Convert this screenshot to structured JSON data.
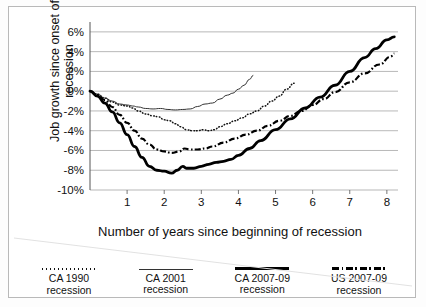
{
  "chart_data": {
    "type": "line",
    "title": "",
    "xlabel": "Number of years since beginning of recession",
    "ylabel": "Job growth since onset of recession",
    "xlim": [
      0,
      8.3
    ],
    "ylim": [
      -10,
      7
    ],
    "grid": true,
    "gridlines": "horizontal",
    "legend_position": "bottom",
    "ytick_labels": [
      "6%",
      "4%",
      "2%",
      "0%",
      "-2%",
      "-4%",
      "-6%",
      "-8%",
      "-10%"
    ],
    "ytick_values": [
      6,
      4,
      2,
      0,
      -2,
      -4,
      -6,
      -8,
      -10
    ],
    "xtick_labels": [
      "1",
      "2",
      "3",
      "4",
      "5",
      "6",
      "7",
      "8"
    ],
    "xtick_values": [
      1,
      2,
      3,
      4,
      5,
      6,
      7,
      8
    ],
    "series": [
      {
        "name": "CA 1990 recession",
        "style": "dotted",
        "color": "#111111",
        "x": [
          0,
          0.2,
          0.4,
          0.6,
          0.8,
          1.0,
          1.15,
          1.3,
          1.5,
          1.7,
          1.85,
          2.0,
          2.15,
          2.3,
          2.45,
          2.6,
          2.75,
          2.9,
          3.05,
          3.2,
          3.35,
          3.5,
          3.7,
          3.9,
          4.1,
          4.3,
          4.5,
          4.7,
          4.9,
          5.1,
          5.3,
          5.5
        ],
        "y": [
          0,
          -0.3,
          -0.7,
          -1.1,
          -1.4,
          -1.5,
          -1.7,
          -2.0,
          -2.3,
          -2.5,
          -2.6,
          -2.9,
          -3.0,
          -3.3,
          -3.6,
          -3.9,
          -4.0,
          -4.0,
          -3.9,
          -4.0,
          -3.9,
          -3.6,
          -3.3,
          -3.0,
          -2.7,
          -2.3,
          -2.0,
          -1.5,
          -1.0,
          -0.5,
          0.2,
          0.8
        ]
      },
      {
        "name": "CA 2001 recession",
        "style": "solid-thin",
        "color": "#333333",
        "x": [
          0,
          0.2,
          0.4,
          0.6,
          0.8,
          1.0,
          1.15,
          1.3,
          1.5,
          1.7,
          1.9,
          2.1,
          2.3,
          2.5,
          2.7,
          2.9,
          3.1,
          3.3,
          3.5,
          3.7,
          3.85,
          4.0,
          4.15,
          4.3,
          4.4
        ],
        "y": [
          0,
          -0.3,
          -0.7,
          -1.0,
          -1.3,
          -1.4,
          -1.5,
          -1.6,
          -1.75,
          -1.8,
          -1.75,
          -1.85,
          -1.9,
          -1.85,
          -1.8,
          -1.55,
          -1.3,
          -1.2,
          -0.8,
          -0.4,
          -0.2,
          0.2,
          0.6,
          1.2,
          1.6
        ]
      },
      {
        "name": "CA 2007-09 recession",
        "style": "solid-thick",
        "color": "#000000",
        "x": [
          0,
          0.2,
          0.4,
          0.6,
          0.8,
          1.0,
          1.2,
          1.4,
          1.6,
          1.8,
          2.0,
          2.2,
          2.35,
          2.5,
          2.6,
          2.8,
          3.0,
          3.2,
          3.4,
          3.6,
          3.8,
          4.0,
          4.3,
          4.6,
          5.0,
          5.4,
          5.8,
          6.2,
          6.6,
          7.0,
          7.4,
          7.7,
          8.0,
          8.2
        ],
        "y": [
          0,
          -0.5,
          -1.2,
          -2.1,
          -3.2,
          -4.4,
          -5.6,
          -6.7,
          -7.6,
          -8.0,
          -8.1,
          -8.3,
          -8.0,
          -7.6,
          -7.8,
          -7.8,
          -7.6,
          -7.4,
          -7.2,
          -7.1,
          -6.9,
          -6.5,
          -5.8,
          -5.0,
          -3.9,
          -2.8,
          -1.7,
          -0.6,
          0.6,
          2.0,
          3.4,
          4.3,
          5.2,
          5.5
        ]
      },
      {
        "name": "US 2007-09 recession",
        "style": "dash-dot",
        "color": "#000000",
        "x": [
          0,
          0.2,
          0.4,
          0.6,
          0.8,
          1.0,
          1.2,
          1.4,
          1.6,
          1.8,
          2.0,
          2.2,
          2.4,
          2.55,
          2.7,
          2.9,
          3.1,
          3.3,
          3.6,
          3.9,
          4.2,
          4.5,
          4.8,
          5.1,
          5.4,
          5.7,
          6.0,
          6.3,
          6.6,
          7.0,
          7.4,
          7.8,
          8.1,
          8.2
        ],
        "y": [
          0,
          -0.4,
          -0.9,
          -1.6,
          -2.4,
          -3.2,
          -4.0,
          -4.8,
          -5.4,
          -5.9,
          -6.1,
          -6.25,
          -6.1,
          -5.8,
          -5.9,
          -5.9,
          -5.8,
          -5.6,
          -5.2,
          -4.8,
          -4.4,
          -4.0,
          -3.5,
          -3.0,
          -2.5,
          -2.0,
          -1.4,
          -0.8,
          -0.1,
          0.9,
          1.8,
          2.7,
          3.5,
          3.8
        ]
      }
    ]
  },
  "legend": {
    "items": [
      {
        "line1": "CA 1990",
        "line2": "recession",
        "style": "dotted"
      },
      {
        "line1": "CA 2001",
        "line2": "recession",
        "style": "solid-thin"
      },
      {
        "line1": "CA 2007-09",
        "line2": "recession",
        "style": "solid-thick"
      },
      {
        "line1": "US 2007-09",
        "line2": "recession",
        "style": "dash-dot"
      }
    ]
  }
}
